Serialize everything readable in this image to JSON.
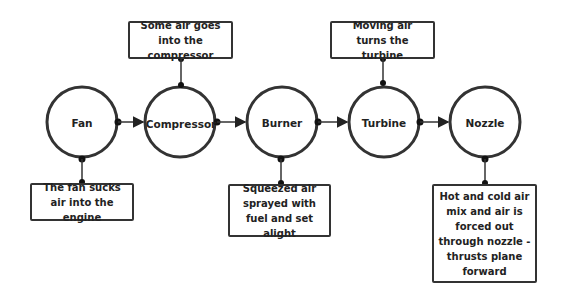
{
  "diagram": {
    "title": "",
    "nodes": [
      {
        "id": "fan",
        "label": "Fan"
      },
      {
        "id": "compressor",
        "label": "Compressor"
      },
      {
        "id": "burner",
        "label": "Burner"
      },
      {
        "id": "turbine",
        "label": "Turbine"
      },
      {
        "id": "nozzle",
        "label": "Nozzle"
      }
    ],
    "notes": [
      {
        "node": "fan",
        "position": "below",
        "text": "The fan sucks air into the engine"
      },
      {
        "node": "compressor",
        "position": "above",
        "text": "Some air goes into the compressor"
      },
      {
        "node": "burner",
        "position": "below",
        "text": "Squeezed air sprayed with fuel and set alight"
      },
      {
        "node": "turbine",
        "position": "above",
        "text": "Moving air turns the turbine"
      },
      {
        "node": "nozzle",
        "position": "below",
        "text": "Hot and cold air mix and air is forced out through nozzle - thrusts plane forward"
      }
    ],
    "edges": [
      {
        "from": "fan",
        "to": "compressor"
      },
      {
        "from": "compressor",
        "to": "burner"
      },
      {
        "from": "burner",
        "to": "turbine"
      },
      {
        "from": "turbine",
        "to": "nozzle"
      }
    ],
    "colors": {
      "stroke": "#333333",
      "background": "#ffffff",
      "text": "#222222"
    }
  }
}
